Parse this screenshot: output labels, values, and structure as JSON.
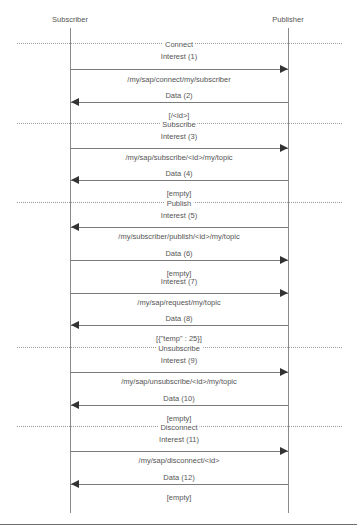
{
  "diagram": {
    "type": "sequence",
    "actors": [
      {
        "name": "Subscriber",
        "x": 70
      },
      {
        "name": "Publisher",
        "x": 288
      }
    ],
    "sections": [
      {
        "label": "Connect",
        "y": 43
      },
      {
        "label": "Subscribe",
        "y": 123
      },
      {
        "label": "Publish",
        "y": 202
      },
      {
        "label": "Unsubscribe",
        "y": 347
      },
      {
        "label": "Disconnect",
        "y": 426
      }
    ],
    "messages": [
      {
        "label": "Interest (1)",
        "note": "/my/sap/connect/my/subscriber",
        "from": "Subscriber",
        "to": "Publisher",
        "direction": "right",
        "label_y": 56,
        "arrow_y": 69,
        "note_y": 75
      },
      {
        "label": "Data (2)",
        "note": "[/<id>]",
        "from": "Publisher",
        "to": "Subscriber",
        "direction": "left",
        "label_y": 95,
        "arrow_y": 102,
        "note_y": 111
      },
      {
        "label": "Interest (3)",
        "note": "/my/sap/subscribe/<id>/my/topic",
        "from": "Subscriber",
        "to": "Publisher",
        "direction": "right",
        "label_y": 136,
        "arrow_y": 148,
        "note_y": 153
      },
      {
        "label": "Data (4)",
        "note": "[empty]",
        "from": "Publisher",
        "to": "Subscriber",
        "direction": "left",
        "label_y": 173,
        "arrow_y": 180,
        "note_y": 189
      },
      {
        "label": "Interest (5)",
        "note": "/my/subscriber/publish/<id>/my/topic",
        "from": "Publisher",
        "to": "Subscriber",
        "direction": "left",
        "label_y": 215,
        "arrow_y": 227,
        "note_y": 232
      },
      {
        "label": "Data (6)",
        "note": "[empty]",
        "from": "Subscriber",
        "to": "Publisher",
        "direction": "right",
        "label_y": 253,
        "arrow_y": 260,
        "note_y": 269
      },
      {
        "label": "Interest (7)",
        "note": "/my/sap/request/my/topic",
        "from": "Subscriber",
        "to": "Publisher",
        "direction": "right",
        "label_y": 281,
        "arrow_y": 293,
        "note_y": 298
      },
      {
        "label": "Data (8)",
        "note": "[{\"temp\" : 25}]",
        "from": "Publisher",
        "to": "Subscriber",
        "direction": "left",
        "label_y": 318,
        "arrow_y": 325,
        "note_y": 334
      },
      {
        "label": "Interest (9)",
        "note": "/my/sap/unsubscribe/<id>/my/topic",
        "from": "Subscriber",
        "to": "Publisher",
        "direction": "right",
        "label_y": 360,
        "arrow_y": 372,
        "note_y": 377
      },
      {
        "label": "Data (10)",
        "note": "[empty]",
        "from": "Publisher",
        "to": "Subscriber",
        "direction": "left",
        "label_y": 398,
        "arrow_y": 405,
        "note_y": 414
      },
      {
        "label": "Interest (11)",
        "note": "/my/sap/disconnect/<id>",
        "from": "Subscriber",
        "to": "Publisher",
        "direction": "right",
        "label_y": 439,
        "arrow_y": 451,
        "note_y": 456
      },
      {
        "label": "Data (12)",
        "note": "[empty]",
        "from": "Publisher",
        "to": "Subscriber",
        "direction": "left",
        "label_y": 477,
        "arrow_y": 484,
        "note_y": 493
      }
    ]
  }
}
